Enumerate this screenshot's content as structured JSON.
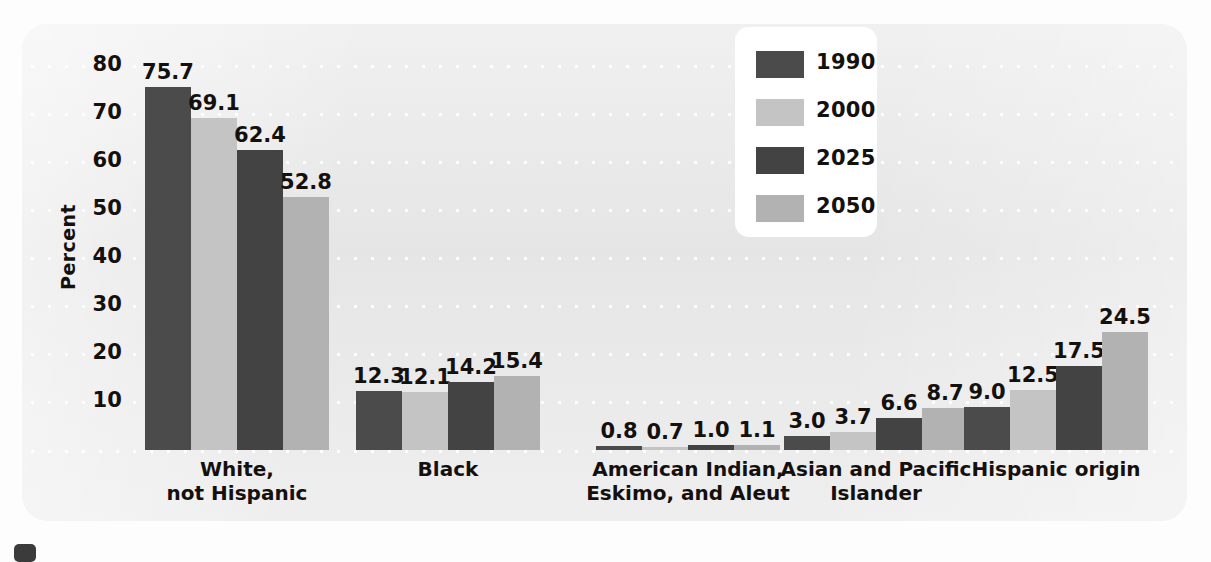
{
  "chart_data": {
    "type": "bar",
    "title": "",
    "subtitle": "",
    "xlabel": "",
    "ylabel": "Percent",
    "ylim": [
      0,
      84
    ],
    "yticks": [
      10,
      20,
      30,
      40,
      50,
      60,
      70,
      80
    ],
    "grid": "horizontal-dotted-white",
    "legend_position": "top-center-right",
    "categories": [
      "White,\nnot Hispanic",
      "Black",
      "American Indian,\nEskimo, and Aleut",
      "Asian and Pacific\nIslander",
      "Hispanic origin"
    ],
    "category_lines": [
      [
        "White,",
        "not Hispanic"
      ],
      [
        "Black"
      ],
      [
        "American Indian,",
        "Eskimo, and Aleut"
      ],
      [
        "Asian and Pacific",
        "Islander"
      ],
      [
        "Hispanic origin"
      ]
    ],
    "series": [
      {
        "name": "1990",
        "color": "#4b4b4b",
        "values": [
          75.7,
          12.3,
          0.8,
          3.0,
          9.0
        ]
      },
      {
        "name": "2000",
        "color": "#c4c4c4",
        "values": [
          69.1,
          12.1,
          0.7,
          3.7,
          12.5
        ]
      },
      {
        "name": "2025",
        "color": "#434343",
        "values": [
          62.4,
          14.2,
          1.0,
          6.6,
          17.5
        ]
      },
      {
        "name": "2050",
        "color": "#b2b2b2",
        "values": [
          52.8,
          15.4,
          1.1,
          8.7,
          24.5
        ]
      }
    ],
    "value_labels": [
      [
        "75.7",
        "69.1",
        "62.4",
        "52.8"
      ],
      [
        "12.3",
        "12.1",
        "14.2",
        "15.4"
      ],
      [
        "0.8",
        "0.7",
        "1.0",
        "1.1"
      ],
      [
        "3.0",
        "3.7",
        "6.6",
        "8.7"
      ],
      [
        "9.0",
        "12.5",
        "17.5",
        "24.5"
      ]
    ]
  },
  "legend": {
    "items": [
      {
        "label": "1990",
        "color": "#4b4b4b"
      },
      {
        "label": "2000",
        "color": "#c4c4c4"
      },
      {
        "label": "2025",
        "color": "#434343"
      },
      {
        "label": "2050",
        "color": "#b2b2b2"
      }
    ]
  },
  "axis": {
    "y_label": "Percent",
    "y_ticks": [
      "80",
      "70",
      "60",
      "50",
      "40",
      "30",
      "20",
      "10"
    ]
  },
  "colors": {
    "panel_background": "#eaeaea",
    "page_background": "#fdfdfd",
    "gridline": "#ffffff",
    "text": "#15100d",
    "legend_background": "#ffffff"
  }
}
